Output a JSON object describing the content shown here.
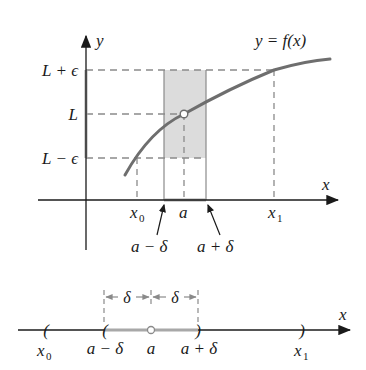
{
  "top_graph": {
    "y_axis_label": "y",
    "x_axis_label": "x",
    "curve_label": "y = f(x)",
    "y_ticks": {
      "upper": "L + ϵ",
      "mid": "L",
      "lower": "L − ϵ"
    },
    "x_ticks": {
      "x0": "x",
      "x0_sub": "0",
      "a": "a",
      "x1": "x",
      "x1_sub": "1"
    },
    "arrow_labels": {
      "left": "a − δ",
      "right": "a + δ"
    }
  },
  "number_line": {
    "axis_label": "x",
    "delta_left": "δ",
    "delta_right": "δ",
    "ticks": {
      "x0": "x",
      "x0_sub": "0",
      "a_minus_delta": "a − δ",
      "a": "a",
      "a_plus_delta": "a + δ",
      "x1": "x",
      "x1_sub": "1"
    }
  },
  "colors": {
    "curve": "#6e6e6e",
    "shade": "#dcdcdc",
    "dash": "#8a8a8a",
    "axis": "#1a1a1a",
    "interval": "#a8a8a8"
  }
}
